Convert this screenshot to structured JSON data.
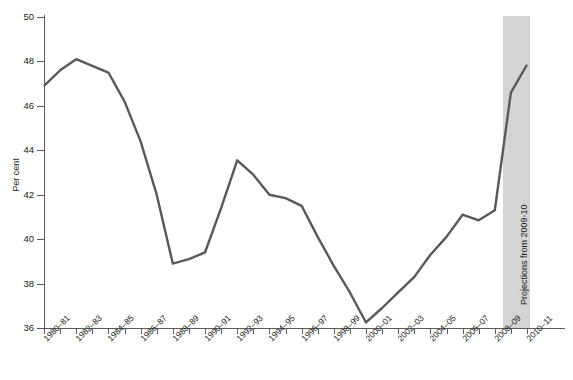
{
  "chart_data": {
    "type": "line",
    "title": "",
    "subtitle": "",
    "xlabel": "",
    "ylabel": "Per cent",
    "ylim": [
      36,
      50
    ],
    "ytick_step": 2,
    "yticks": [
      36,
      38,
      40,
      42,
      44,
      46,
      48,
      50
    ],
    "grid": false,
    "legend": "none",
    "line_color": "#595959",
    "projection_shade_color": "#d4d4d4",
    "axis_color": "#5a5a5a",
    "annotations": [
      {
        "name": "projection-band-label",
        "text": "Projections from 2009-10",
        "orientation": "vertical",
        "from_category": "2009-10",
        "to_category": "2010-11"
      }
    ],
    "x": [
      "1980-81",
      "1981-82",
      "1982-83",
      "1983-84",
      "1984-85",
      "1985-86",
      "1986-87",
      "1987-88",
      "1988-89",
      "1989-90",
      "1990-91",
      "1991-92",
      "1992-93",
      "1993-94",
      "1994-95",
      "1995-96",
      "1996-97",
      "1997-98",
      "1998-99",
      "1999-00",
      "2000-01",
      "2001-02",
      "2002-03",
      "2003-04",
      "2004-05",
      "2005-06",
      "2006-07",
      "2007-08",
      "2008-09",
      "2009-10",
      "2010-11"
    ],
    "xtick_labels": [
      "1980-81",
      "1982-83",
      "1984-85",
      "1986-87",
      "1988-89",
      "1990-91",
      "1992-93",
      "1994-95",
      "1996-97",
      "1998-99",
      "2000-01",
      "2002-03",
      "2004-05",
      "2006-07",
      "2008-09",
      "2010-11"
    ],
    "values": [
      46.9,
      47.6,
      48.1,
      47.8,
      47.5,
      46.2,
      44.4,
      42.0,
      38.9,
      39.1,
      39.4,
      41.4,
      43.55,
      42.9,
      42.0,
      41.85,
      41.5,
      40.1,
      38.8,
      37.6,
      36.25,
      36.9,
      37.6,
      38.3,
      39.3,
      40.1,
      41.1,
      40.85,
      41.3,
      46.6,
      47.85
    ],
    "series_name": "Per cent"
  }
}
